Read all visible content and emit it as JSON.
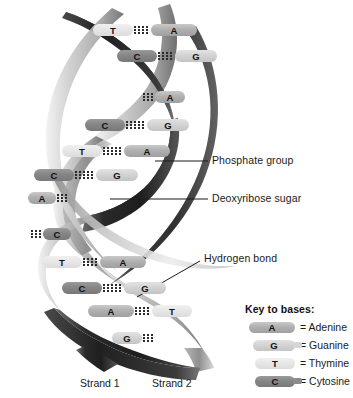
{
  "figure": {
    "background_color": "#ffffff"
  },
  "annotations": [
    {
      "id": "phosphate",
      "label": "Phosphate group",
      "leader": "horizontal"
    },
    {
      "id": "deoxyribose",
      "label": "Deoxyribose sugar",
      "leader": "horizontal"
    },
    {
      "id": "hydrogen",
      "label": "Hydrogen bond",
      "leader": "diagonal"
    }
  ],
  "strand_labels": [
    {
      "id": "strand1",
      "label": "Strand 1"
    },
    {
      "id": "strand2",
      "label": "Strand 2"
    }
  ],
  "base_pairs": [
    {
      "index": 1,
      "left": "T",
      "right": "A",
      "complete": true
    },
    {
      "index": 2,
      "left": "C",
      "right": "G",
      "complete": true
    },
    {
      "index": 3,
      "left": "",
      "right": "A",
      "complete": false
    },
    {
      "index": 4,
      "left": "C",
      "right": "G",
      "complete": true
    },
    {
      "index": 5,
      "left": "T",
      "right": "A",
      "complete": true
    },
    {
      "index": 6,
      "left": "C",
      "right": "G",
      "complete": true
    },
    {
      "index": 7,
      "left": "A",
      "right": "",
      "complete": false
    },
    {
      "index": 8,
      "left": "",
      "right": "C",
      "complete": false
    },
    {
      "index": 9,
      "left": "T",
      "right": "A",
      "complete": true
    },
    {
      "index": 10,
      "left": "C",
      "right": "G",
      "complete": true
    },
    {
      "index": 11,
      "left": "A",
      "right": "T",
      "complete": true
    },
    {
      "index": 12,
      "left": "G",
      "right": "",
      "complete": false
    }
  ],
  "legend": {
    "title": "Key to bases:",
    "items": [
      {
        "code": "A",
        "equals": "= Adenine",
        "color": "#b0b0b0"
      },
      {
        "code": "G",
        "equals": "= Guanine",
        "color": "#d2d2d2"
      },
      {
        "code": "T",
        "equals": "= Thymine",
        "color": "#e6e6e6"
      },
      {
        "code": "C",
        "equals": "= Cytosine",
        "color": "#868686"
      }
    ]
  },
  "colors": {
    "ribbon_dark": "#2f2f2f",
    "ribbon_mid": "#8a8a8a",
    "ribbon_light": "#d8d8d8",
    "text": "#1a1a1a",
    "hbond_dot": "#2b2b2b"
  }
}
